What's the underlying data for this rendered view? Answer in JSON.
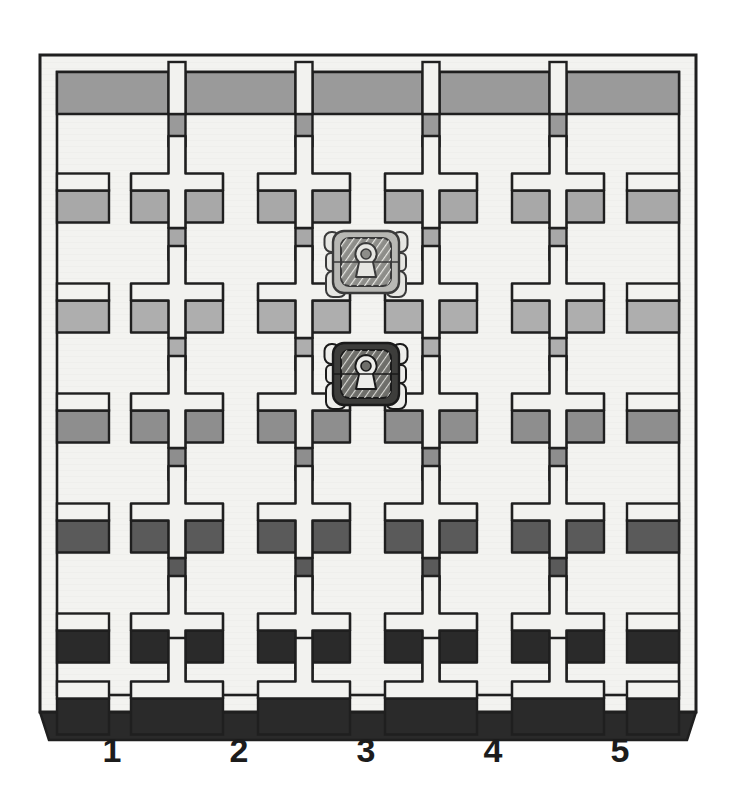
{
  "scene": {
    "title": "Grid maze top-down view with two robots",
    "background_color": "#ffffff",
    "paper_color": "#f6f6f3"
  },
  "maze": {
    "frame": {
      "x": 40,
      "y": 55,
      "width": 656,
      "height": 657,
      "face_color": "#f4f4f1",
      "outline_color": "#1f1f1f",
      "rim_thickness": 17
    },
    "columns": 5,
    "rows": 6,
    "post_shape": "plus-cross",
    "col_centers": [
      50,
      177,
      304,
      431,
      558,
      686
    ],
    "row_centers": [
      72,
      182,
      292,
      402,
      512,
      622,
      700
    ],
    "arm_length": 46,
    "arm_thickness": 17,
    "shadow_depth": 32,
    "shadow_colors_by_row": [
      "#9a9a9a",
      "#a8a8a8",
      "#aeaeae",
      "#8e8e8e",
      "#5a5a5a",
      "#2a2a2a"
    ],
    "face_color": "#f2f2ef",
    "outline_color": "#1f1f1f"
  },
  "robots": [
    {
      "id": "robot-light",
      "label": "light robot",
      "cx": 366,
      "cy": 262,
      "body_color": "#b8b8b4",
      "plate_color": "#8d8d89",
      "wheel_color": "#e6e6e2",
      "outline_color": "#3a3a3a",
      "grid_column": 3,
      "grid_row": 2
    },
    {
      "id": "robot-dark",
      "label": "dark robot",
      "cx": 366,
      "cy": 374,
      "body_color": "#3d3d3b",
      "plate_color": "#6e6e6a",
      "wheel_color": "#ededea",
      "outline_color": "#1a1a1a",
      "grid_column": 3,
      "grid_row": 3
    }
  ],
  "axis": {
    "orientation": "bottom",
    "labels": [
      {
        "text": "1",
        "x": 112
      },
      {
        "text": "2",
        "x": 239
      },
      {
        "text": "3",
        "x": 366
      },
      {
        "text": "4",
        "x": 493
      },
      {
        "text": "5",
        "x": 620
      }
    ]
  },
  "chart_data": {
    "type": "diagram",
    "categories": [
      "1",
      "2",
      "3",
      "4",
      "5"
    ],
    "xlabel": "column",
    "ylabel": "",
    "grid": true,
    "legend": "none"
  }
}
